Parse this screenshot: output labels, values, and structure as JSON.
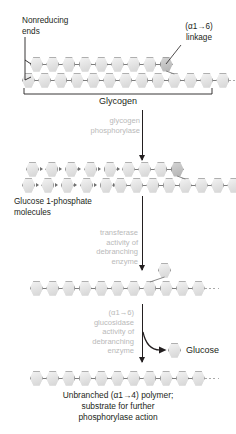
{
  "diagram": {
    "labels": {
      "nonreducing_ends": "Nonreducing\nends",
      "alpha16_linkage": "(α1→6)\nlinkage",
      "glycogen": "Glycogen",
      "glucose_1_phosphate": "Glucose 1-phosphate\nmolecules",
      "glucose": "Glucose"
    },
    "enzyme_steps": [
      {
        "id": "phosphorylase",
        "text": "glycogen\nphosphorylase"
      },
      {
        "id": "transferase",
        "text": "transferase\nactivity of\ndebranching\nenzyme"
      },
      {
        "id": "glucosidase",
        "text": "(α1→6)\nglucosidase\nactivity of\ndebranching\nenzyme"
      }
    ],
    "caption": "Unbranched (α1→4) polymer;\nsubstrate for further\nphosphorylase action",
    "stages": [
      {
        "id": "stage-glycogen",
        "rows": [
          {
            "id": "branch-chain",
            "hexagons": 9,
            "branch_point_index": 8,
            "detached": false
          },
          {
            "id": "main-chain",
            "hexagons": 13,
            "branch_point_index": 9,
            "detached": false
          }
        ]
      },
      {
        "id": "stage-after-phosphorylase",
        "rows": [
          {
            "id": "released-g1p-upper",
            "hexagons": 5,
            "detached": true
          },
          {
            "id": "released-g1p-lower",
            "hexagons": 5,
            "detached": true
          },
          {
            "id": "limit-branch",
            "hexagons": 4,
            "branch_point_index": 3,
            "detached": false
          },
          {
            "id": "limit-main",
            "hexagons": 8,
            "branch_point_index": 4,
            "detached": false
          }
        ]
      },
      {
        "id": "stage-after-transferase",
        "rows": [
          {
            "id": "single-branch-glucose",
            "hexagons": 1,
            "detached": false
          },
          {
            "id": "extended-main-chain",
            "hexagons": 11,
            "branch_point_index": 7,
            "detached": false
          }
        ]
      },
      {
        "id": "stage-unbranched",
        "rows": [
          {
            "id": "unbranched-chain",
            "hexagons": 11,
            "detached": false
          }
        ]
      }
    ],
    "colors": {
      "hexagon_fill": "#e8e8e8",
      "hexagon_stroke": "#9a9a9a",
      "hexagon_dark_fill": "#c6c6c6",
      "enzyme_text": "#b9b9b9",
      "text": "#231f20",
      "bond": "#7d7d7d",
      "background": "#ffffff"
    }
  }
}
